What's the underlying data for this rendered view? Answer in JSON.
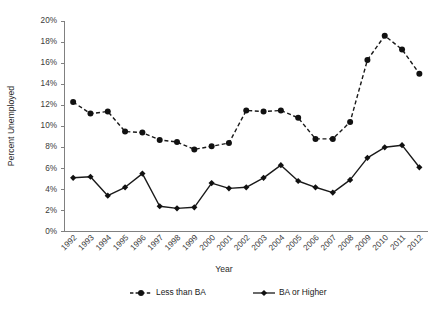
{
  "chart_data": {
    "type": "line",
    "title": "",
    "xlabel": "Year",
    "ylabel": "Percent Unemployed",
    "grid": false,
    "legend_position": "bottom",
    "ylim": [
      0,
      20
    ],
    "ytick_step": 2,
    "ytick_labels": [
      "0%",
      "2%",
      "4%",
      "6%",
      "8%",
      "10%",
      "12%",
      "14%",
      "16%",
      "18%",
      "20%"
    ],
    "ytick_values": [
      0,
      2,
      4,
      6,
      8,
      10,
      12,
      14,
      16,
      18,
      20
    ],
    "categories": [
      "1992",
      "1993",
      "1994",
      "1995",
      "1996",
      "1997",
      "1998",
      "1999",
      "2000",
      "2001",
      "2002",
      "2003",
      "2004",
      "2005",
      "2006",
      "2007",
      "2008",
      "2009",
      "2010",
      "2011",
      "2012"
    ],
    "series": [
      {
        "name": "Less than BA",
        "style": "dashed",
        "marker": "circle",
        "color": "#111111",
        "values": [
          12.3,
          11.2,
          11.4,
          9.5,
          9.4,
          8.7,
          8.5,
          7.8,
          8.1,
          8.4,
          11.5,
          11.4,
          11.5,
          10.8,
          8.8,
          8.8,
          10.4,
          16.3,
          18.6,
          17.3,
          15.0
        ]
      },
      {
        "name": "BA or Higher",
        "style": "solid",
        "marker": "diamond",
        "color": "#111111",
        "values": [
          5.1,
          5.2,
          3.4,
          4.2,
          5.5,
          2.4,
          2.2,
          2.3,
          4.6,
          4.1,
          4.2,
          5.1,
          6.3,
          4.8,
          4.2,
          3.7,
          4.9,
          7.0,
          8.0,
          8.2,
          6.1
        ]
      }
    ]
  },
  "legend": {
    "items": [
      {
        "label": "Less than BA"
      },
      {
        "label": "BA or Higher"
      }
    ]
  },
  "axes": {
    "x_title": "Year",
    "y_title": "Percent Unemployed"
  }
}
